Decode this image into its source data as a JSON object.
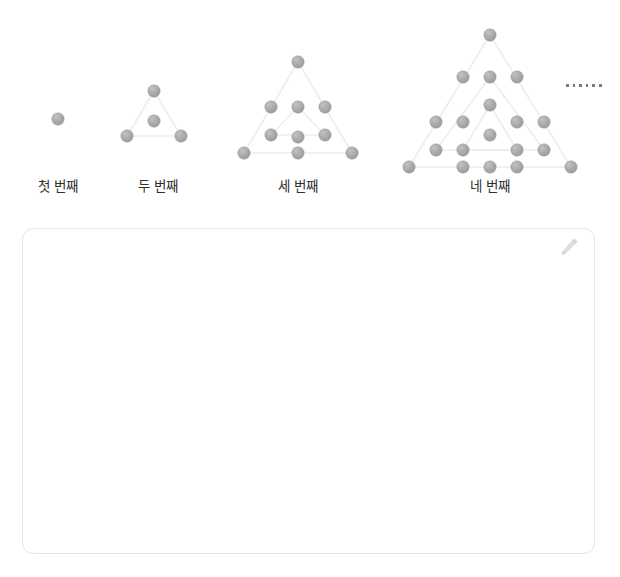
{
  "page": {
    "background_color": "#ffffff",
    "width": 620,
    "height": 577
  },
  "figures": {
    "dot_color": "#a9a9a9",
    "dot_edge_color": "#9a9a9a",
    "line_color": "#ededed",
    "dot_radius": 6.2,
    "items": [
      {
        "index": 1,
        "label": "첫 번째",
        "label_x": 58,
        "label_y": 182,
        "dot_count": 1,
        "triangle_layers": 1,
        "dots": [
          [
            58,
            119
          ]
        ],
        "lines": []
      },
      {
        "index": 2,
        "label": "두 번째",
        "label_x": 158,
        "label_y": 182,
        "dot_count": 4,
        "triangle_layers": 1,
        "dots": [
          [
            154,
            91
          ],
          [
            154,
            121
          ],
          [
            127,
            136
          ],
          [
            181,
            136
          ]
        ],
        "lines": [
          [
            154,
            91,
            127,
            136
          ],
          [
            154,
            91,
            181,
            136
          ],
          [
            127,
            136,
            181,
            136
          ]
        ]
      },
      {
        "index": 3,
        "label": "세 번째",
        "label_x": 298,
        "label_y": 182,
        "dot_count": 10,
        "triangle_layers": 2,
        "dots": [
          [
            298,
            62
          ],
          [
            298,
            107
          ],
          [
            271,
            107
          ],
          [
            325,
            107
          ],
          [
            298,
            137
          ],
          [
            271,
            135
          ],
          [
            325,
            135
          ],
          [
            244,
            153
          ],
          [
            298,
            153
          ],
          [
            352,
            153
          ]
        ],
        "lines": [
          [
            298,
            62,
            244,
            153
          ],
          [
            298,
            62,
            352,
            153
          ],
          [
            244,
            153,
            352,
            153
          ],
          [
            298,
            107,
            271,
            135
          ],
          [
            298,
            107,
            325,
            135
          ],
          [
            271,
            135,
            325,
            135
          ]
        ]
      },
      {
        "index": 4,
        "label": "네 번째",
        "label_x": 490,
        "label_y": 182,
        "dot_count": 19,
        "triangle_layers": 3,
        "dots": [
          [
            490,
            35
          ],
          [
            490,
            77
          ],
          [
            463,
            77
          ],
          [
            517,
            77
          ],
          [
            490,
            105
          ],
          [
            436,
            122
          ],
          [
            463,
            122
          ],
          [
            517,
            122
          ],
          [
            544,
            122
          ],
          [
            490,
            135
          ],
          [
            463,
            150
          ],
          [
            517,
            150
          ],
          [
            436,
            150
          ],
          [
            544,
            150
          ],
          [
            409,
            167
          ],
          [
            463,
            167
          ],
          [
            517,
            167
          ],
          [
            571,
            167
          ],
          [
            490,
            167
          ]
        ],
        "lines": [
          [
            490,
            35,
            409,
            167
          ],
          [
            490,
            35,
            571,
            167
          ],
          [
            409,
            167,
            571,
            167
          ],
          [
            490,
            77,
            436,
            150
          ],
          [
            490,
            77,
            544,
            150
          ],
          [
            436,
            150,
            544,
            150
          ],
          [
            490,
            105,
            463,
            150
          ],
          [
            490,
            105,
            517,
            150
          ],
          [
            463,
            150,
            517,
            150
          ]
        ]
      }
    ]
  },
  "ellipsis": {
    "name": "continuation-ellipsis",
    "dot_count": 6,
    "text": "……"
  },
  "answer_box": {
    "placeholder": "",
    "value": "",
    "border_color": "#e3e5e7",
    "icon": "pencil-icon"
  }
}
